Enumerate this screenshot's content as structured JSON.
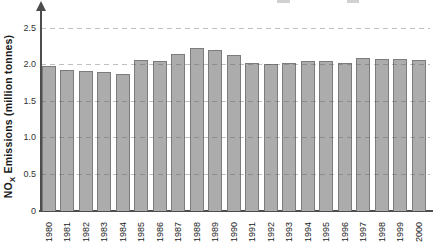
{
  "chart_data": {
    "type": "bar",
    "title": "",
    "ylabel": {
      "prefix": "NO",
      "sub": "X",
      "rest": " Emissions (million tonnes)"
    },
    "xlabel": "",
    "categories": [
      "1980",
      "1981",
      "1982",
      "1983",
      "1984",
      "1985",
      "1986",
      "1987",
      "1988",
      "1989",
      "1990",
      "1991",
      "1992",
      "1993",
      "1994",
      "1995",
      "1996",
      "1997",
      "1998",
      "1999",
      "2000"
    ],
    "values": [
      1.97,
      1.91,
      1.9,
      1.89,
      1.86,
      2.05,
      2.04,
      2.13,
      2.21,
      2.19,
      2.12,
      2.01,
      2.0,
      2.01,
      2.03,
      2.04,
      2.01,
      2.07,
      2.06,
      2.06,
      2.05
    ],
    "ylim": [
      0,
      2.5
    ],
    "y_ticks": [
      0,
      0.5,
      1.0,
      1.5,
      2.0,
      2.5
    ],
    "y_tick_labels": [
      "0",
      "0.5",
      "1.0",
      "1.5",
      "2.0",
      "2.5"
    ],
    "grid": "horizontal-dashed",
    "legend": "none",
    "colors": {
      "bar_fill": "#acacac",
      "bar_border": "#7c7c7c",
      "axis": "#4d4d4d",
      "gridline": "#b3b3b3",
      "tick_text": "#333333",
      "label_text": "#1a1a1a",
      "background": "#ffffff"
    }
  }
}
